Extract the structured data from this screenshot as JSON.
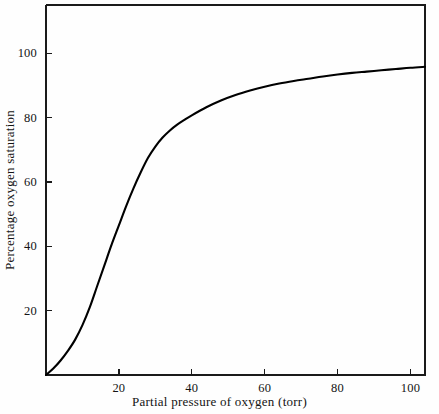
{
  "chart_data": {
    "type": "line",
    "title": "",
    "subtitle": "",
    "xlabel": "Partial pressure of oxygen (torr)",
    "ylabel": "Percentage oxygen saturation",
    "xlim": [
      0,
      104
    ],
    "ylim": [
      0,
      115
    ],
    "grid": false,
    "legend": null,
    "legend_position": "none",
    "xticks": [
      20,
      40,
      60,
      80,
      100
    ],
    "yticks": [
      20,
      40,
      60,
      80,
      100
    ],
    "xtick_labels": [
      "20",
      "40",
      "60",
      "80",
      "100"
    ],
    "ytick_labels": [
      "20",
      "40",
      "60",
      "80",
      "100"
    ],
    "series": [
      {
        "name": "Oxygen-hemoglobin dissociation curve",
        "color": "#000000",
        "x": [
          0,
          2,
          4,
          6,
          8,
          10,
          12,
          14,
          16,
          18,
          20,
          22,
          24,
          26,
          28,
          30,
          32,
          34,
          36,
          38,
          40,
          44,
          48,
          52,
          56,
          60,
          64,
          68,
          72,
          76,
          80,
          84,
          88,
          92,
          96,
          100,
          104
        ],
        "y": [
          0,
          2,
          4.5,
          7.5,
          11,
          15.5,
          21,
          27.5,
          34,
          40.5,
          46.5,
          52.5,
          58,
          63,
          67.5,
          71,
          73.8,
          76,
          77.8,
          79.3,
          80.7,
          83.2,
          85.3,
          87.0,
          88.4,
          89.6,
          90.6,
          91.4,
          92.1,
          92.8,
          93.4,
          93.9,
          94.3,
          94.7,
          95.1,
          95.5,
          95.8
        ]
      }
    ],
    "annotations": [],
    "axis_color": "#1a1a1a",
    "background_color": "#fefefe"
  },
  "figure": {
    "caption": "",
    "xlabel": "Partial pressure of oxygen (torr)",
    "ylabel": "Percentage oxygen saturation",
    "xtick_0": "20",
    "xtick_1": "40",
    "xtick_2": "60",
    "xtick_3": "80",
    "xtick_4": "100",
    "ytick_0": "20",
    "ytick_1": "40",
    "ytick_2": "60",
    "ytick_3": "80",
    "ytick_4": "100"
  }
}
